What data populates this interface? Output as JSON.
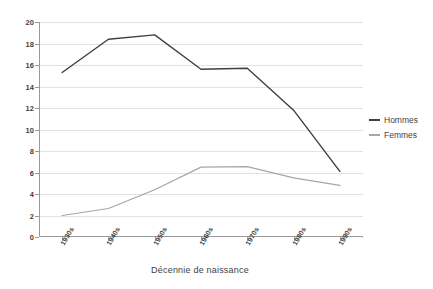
{
  "chart_data": {
    "type": "line",
    "title": "",
    "xlabel": "Décennie de naissance",
    "ylabel": "",
    "categories": [
      "1930s",
      "1940s",
      "1950s",
      "1960s",
      "1970s",
      "1980s",
      "1990s"
    ],
    "series": [
      {
        "name": "Hommes",
        "color": "#404040",
        "values": [
          15.3,
          18.4,
          18.8,
          15.6,
          15.7,
          11.8,
          6.1
        ]
      },
      {
        "name": "Femmes",
        "color": "#a6a6a6",
        "values": [
          2.0,
          2.65,
          4.4,
          6.5,
          6.55,
          5.5,
          4.8
        ]
      }
    ],
    "ylim": [
      0,
      20
    ],
    "yticks": [
      0,
      2,
      4,
      6,
      8,
      10,
      12,
      14,
      16,
      18,
      20
    ],
    "ytick_labels": [
      "0",
      "2",
      "4",
      "6",
      "8",
      "10",
      "12",
      "14",
      "16",
      "18",
      "20"
    ],
    "grid": true,
    "grid_axis": "y",
    "legend_position": "right",
    "background": "#ffffff",
    "axis_color": "#9a9a9a",
    "grid_color": "#e2e2e2"
  },
  "legend": {
    "items": [
      {
        "label": "Hommes",
        "color": "#404040"
      },
      {
        "label": "Femmes",
        "color": "#a6a6a6"
      }
    ]
  }
}
